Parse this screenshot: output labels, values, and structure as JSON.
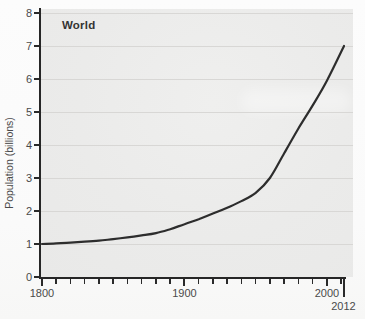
{
  "title": "World",
  "y_axis": {
    "label": "Population (billions)",
    "ticks": [
      "0",
      "1",
      "2",
      "3",
      "4",
      "5",
      "6",
      "7",
      "8"
    ]
  },
  "x_axis": {
    "major_ticks": [
      "1800",
      "1900",
      "2000"
    ],
    "end_tick": "2012",
    "minor_tick_interval_years": 10
  },
  "chart_data": {
    "type": "line",
    "title": "World",
    "xlabel": "",
    "ylabel": "Population (billions)",
    "xlim": [
      1800,
      2012
    ],
    "ylim": [
      0,
      8
    ],
    "grid": "horizontal gridlines at each 1-billion step",
    "legend": "none",
    "series": [
      {
        "name": "World",
        "x": [
          1800,
          1810,
          1820,
          1830,
          1840,
          1850,
          1860,
          1870,
          1880,
          1890,
          1900,
          1910,
          1920,
          1930,
          1940,
          1950,
          1960,
          1970,
          1980,
          1990,
          2000,
          2012
        ],
        "y": [
          1.0,
          1.02,
          1.04,
          1.07,
          1.1,
          1.15,
          1.2,
          1.26,
          1.33,
          1.45,
          1.6,
          1.75,
          1.92,
          2.1,
          2.3,
          2.55,
          3.0,
          3.75,
          4.5,
          5.2,
          5.95,
          7.0
        ]
      }
    ]
  },
  "colors": {
    "plot_background": "#ebebea",
    "page_background": "#fbfbfb",
    "gridline": "#d8d7d5",
    "axis": "#262626",
    "curve": "#2d2d2d",
    "tick_label_text": "#4a4a4a",
    "title_text": "#333333"
  }
}
